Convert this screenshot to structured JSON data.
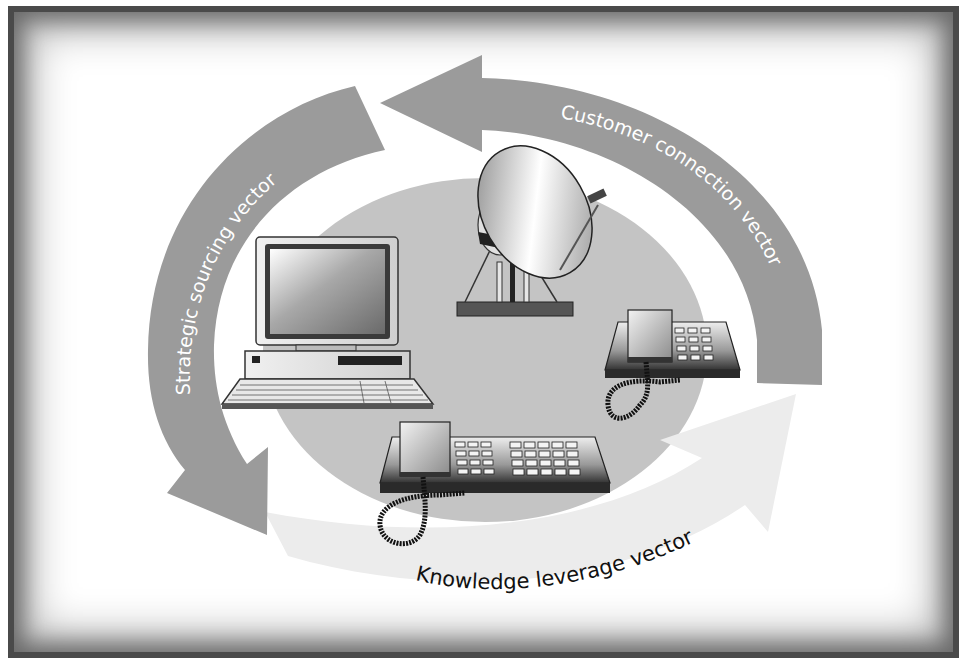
{
  "diagram": {
    "type": "cycle",
    "vectors": [
      {
        "id": "customer",
        "label": "Customer connection vector",
        "color": "#9b9b9b",
        "text_color": "#ffffff"
      },
      {
        "id": "strategic",
        "label": "Strategic sourcing vector",
        "color": "#9b9b9b",
        "text_color": "#ffffff"
      },
      {
        "id": "knowledge",
        "label": "Knowledge leverage vector",
        "color": "#ececec",
        "text_color": "#111111"
      }
    ],
    "center": {
      "shape": "ellipse",
      "color": "#c4c4c4",
      "items": [
        "desktop-computer",
        "satellite-dish",
        "desk-telephone",
        "multi-line-telephone"
      ]
    }
  },
  "colors": {
    "frame": "#4a4a4a",
    "background": "#ffffff"
  }
}
